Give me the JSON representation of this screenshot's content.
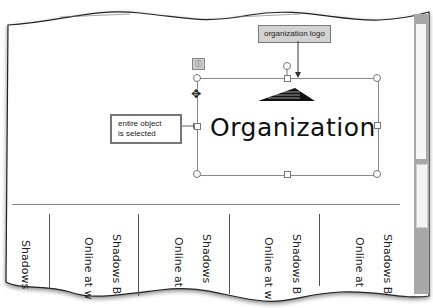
{
  "callouts": {
    "logo": "organization logo",
    "selected_line1": "entire object",
    "selected_line2": "is selected"
  },
  "smartart": {
    "text": "Organization",
    "layout_options_icon": "layout-options-icon"
  },
  "cursor": "move-cursor",
  "columns": [
    {
      "texts": [
        "Shadows"
      ]
    },
    {
      "texts": [
        "Online at w",
        "Shadows B"
      ]
    },
    {
      "texts": [
        "Online at",
        "Shadows"
      ]
    },
    {
      "texts": [
        "Online at w",
        "Shadows B"
      ]
    },
    {
      "texts": [
        "Online at",
        "Shadows B"
      ]
    }
  ]
}
